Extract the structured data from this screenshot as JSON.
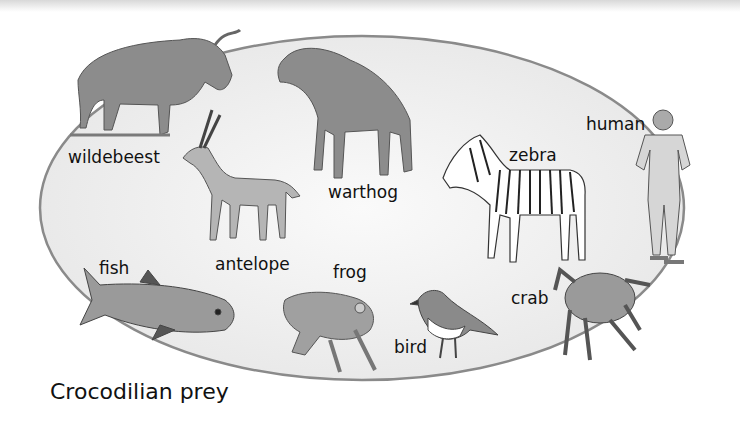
{
  "caption": "Crocodilian prey",
  "animals": [
    {
      "id": "wildebeest",
      "label": "wildebeest"
    },
    {
      "id": "warthog",
      "label": "warthog"
    },
    {
      "id": "antelope",
      "label": "antelope"
    },
    {
      "id": "zebra",
      "label": "zebra"
    },
    {
      "id": "human",
      "label": "human"
    },
    {
      "id": "fish",
      "label": "fish"
    },
    {
      "id": "frog",
      "label": "frog"
    },
    {
      "id": "bird",
      "label": "bird"
    },
    {
      "id": "crab",
      "label": "crab"
    }
  ],
  "colors": {
    "ellipse_fill": "#efefef",
    "ellipse_stroke": "#8a8a8a",
    "animal_gray": "#8c8c8c",
    "text": "#111111"
  }
}
